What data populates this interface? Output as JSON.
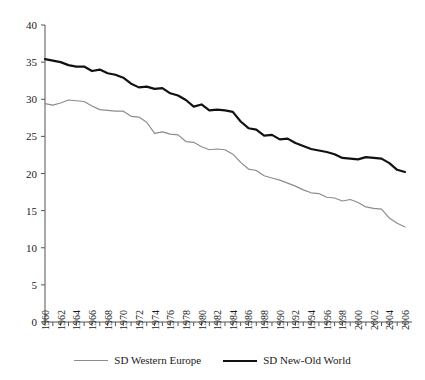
{
  "chart_data": {
    "type": "line",
    "title": "",
    "xlabel": "",
    "ylabel": "",
    "xlim": [
      1960,
      2006
    ],
    "ylim": [
      0,
      40
    ],
    "yticks": [
      0,
      5,
      10,
      15,
      20,
      25,
      30,
      35,
      40
    ],
    "ytick_labels": [
      "0",
      "5",
      "10",
      "15",
      "20",
      "25",
      "30",
      "35",
      "40"
    ],
    "xticks": [
      1960,
      1961,
      1962,
      1963,
      1964,
      1965,
      1966,
      1967,
      1968,
      1969,
      1970,
      1971,
      1972,
      1973,
      1974,
      1975,
      1976,
      1977,
      1978,
      1979,
      1980,
      1981,
      1982,
      1983,
      1984,
      1985,
      1986,
      1987,
      1988,
      1989,
      1990,
      1991,
      1992,
      1993,
      1994,
      1995,
      1996,
      1997,
      1998,
      1999,
      2000,
      2001,
      2002,
      2003,
      2004,
      2005,
      2006
    ],
    "xtick_labels": [
      "1960",
      "",
      "1962",
      "",
      "1964",
      "",
      "1966",
      "",
      "1968",
      "",
      "1970",
      "",
      "1972",
      "",
      "1974",
      "",
      "1976",
      "",
      "1978",
      "",
      "1980",
      "",
      "1982",
      "",
      "1984",
      "",
      "1986",
      "",
      "1988",
      "",
      "1990",
      "",
      "1992",
      "",
      "1994",
      "",
      "1996",
      "",
      "1998",
      "",
      "2000",
      "",
      "2002",
      "",
      "2004",
      "",
      "2006"
    ],
    "grid": false,
    "legend_position": "bottom",
    "x": [
      1960,
      1961,
      1962,
      1963,
      1964,
      1965,
      1966,
      1967,
      1968,
      1969,
      1970,
      1971,
      1972,
      1973,
      1974,
      1975,
      1976,
      1977,
      1978,
      1979,
      1980,
      1981,
      1982,
      1983,
      1984,
      1985,
      1986,
      1987,
      1988,
      1989,
      1990,
      1991,
      1992,
      1993,
      1994,
      1995,
      1996,
      1997,
      1998,
      1999,
      2000,
      2001,
      2002,
      2003,
      2004,
      2005,
      2006
    ],
    "series": [
      {
        "name": "SD Western Europe",
        "color": "#8c8c8c",
        "width": 1.2,
        "values": [
          29.4,
          29.2,
          29.5,
          29.9,
          29.8,
          29.7,
          29.1,
          28.6,
          28.5,
          28.4,
          28.4,
          27.7,
          27.6,
          26.9,
          25.4,
          25.6,
          25.3,
          25.2,
          24.3,
          24.2,
          23.6,
          23.2,
          23.3,
          23.2,
          22.6,
          21.5,
          20.6,
          20.4,
          19.7,
          19.4,
          19.1,
          18.7,
          18.3,
          17.8,
          17.4,
          17.3,
          16.8,
          16.7,
          16.3,
          16.5,
          16.1,
          15.5,
          15.3,
          15.2,
          14.0,
          13.3,
          12.8
        ]
      },
      {
        "name": "SD New-Old World",
        "color": "#111111",
        "width": 2.2,
        "values": [
          35.4,
          35.2,
          35.0,
          34.6,
          34.4,
          34.4,
          33.8,
          34.0,
          33.5,
          33.3,
          32.9,
          32.1,
          31.6,
          31.7,
          31.4,
          31.5,
          30.8,
          30.5,
          29.9,
          29.0,
          29.3,
          28.5,
          28.6,
          28.5,
          28.3,
          27.0,
          26.1,
          25.9,
          25.1,
          25.2,
          24.6,
          24.7,
          24.1,
          23.7,
          23.3,
          23.1,
          22.9,
          22.6,
          22.1,
          22.0,
          21.9,
          22.2,
          22.1,
          22.0,
          21.4,
          20.5,
          20.2
        ]
      }
    ]
  },
  "legend": {
    "entries": [
      {
        "label": "SD Western Europe"
      },
      {
        "label": "SD New-Old World"
      }
    ]
  }
}
